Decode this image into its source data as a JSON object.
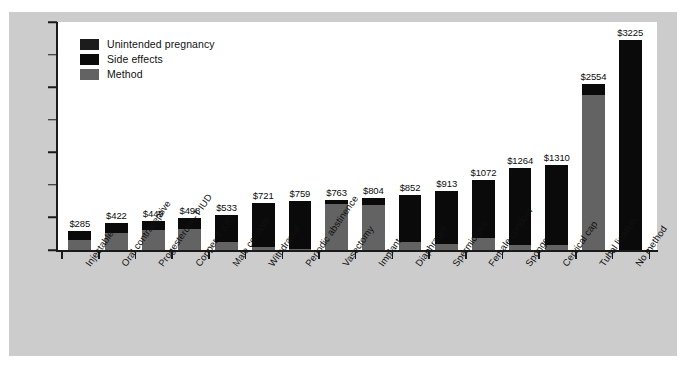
{
  "chart_data": {
    "type": "bar",
    "subtype": "stacked-vertical",
    "title": "",
    "subtitle": "",
    "xlabel": "",
    "ylabel": "",
    "grid": false,
    "legend_position": "top-left",
    "ylim": [
      0,
      3500
    ],
    "y_ticks": [
      0,
      500,
      1000,
      1500,
      2000,
      2500,
      3000,
      3500
    ],
    "y_tick_labels": [
      "$0",
      "$500",
      "$1000",
      "$1500",
      "$3000",
      "$2500",
      "$3000",
      "$3500"
    ],
    "y_tick_labels_note": "Label at the 2000 position reads '$3000' in the original printed chart (typographical error).",
    "categories": [
      "Injectable",
      "Oral contraceptive",
      "Progesterone-T IUD",
      "Copper-T IUD",
      "Male condom",
      "Withdrawal",
      "Periodic abstinence",
      "Vasectomy",
      "Implant",
      "Diaphragm",
      "Spermicides",
      "Female condom",
      "Sponge",
      "Cervical cap",
      "Tubal ligation",
      "No method"
    ],
    "value_labels": [
      "$285",
      "$422",
      "$449",
      "$498",
      "$533",
      "$721",
      "$759",
      "$763",
      "$804",
      "$852",
      "$913",
      "$1072",
      "$1264",
      "$1310",
      "$2554",
      "$3225"
    ],
    "totals": [
      285,
      422,
      449,
      498,
      533,
      721,
      759,
      763,
      804,
      852,
      913,
      1072,
      1264,
      1310,
      2554,
      3225
    ],
    "series": [
      {
        "name": "Method",
        "color": "#636363",
        "values": [
          150,
          260,
          300,
          330,
          130,
          40,
          20,
          700,
          690,
          120,
          90,
          190,
          70,
          80,
          2380,
          0
        ]
      },
      {
        "name": "Side effects",
        "color": "#0a0a0a",
        "values": [
          135,
          162,
          149,
          168,
          403,
          681,
          739,
          63,
          114,
          732,
          823,
          882,
          1194,
          1230,
          174,
          3225
        ]
      },
      {
        "name": "Unintended pregnancy",
        "color": "#1c1c1c",
        "values": [
          0,
          0,
          0,
          0,
          0,
          0,
          0,
          0,
          0,
          0,
          0,
          0,
          0,
          0,
          0,
          0
        ]
      }
    ]
  },
  "legend": {
    "items": [
      {
        "label": "Unintended pregnancy",
        "color": "#1c1c1c",
        "swatch_name": "legend-swatch-unintended-pregnancy"
      },
      {
        "label": "Side effects",
        "color": "#0a0a0a",
        "swatch_name": "legend-swatch-side-effects"
      },
      {
        "label": "Method",
        "color": "#636363",
        "swatch_name": "legend-swatch-method"
      }
    ]
  },
  "colors": {
    "paper": "#cccccc",
    "canvas": "#ffffff",
    "axis": "#1a1a1a",
    "text": "#111111"
  }
}
